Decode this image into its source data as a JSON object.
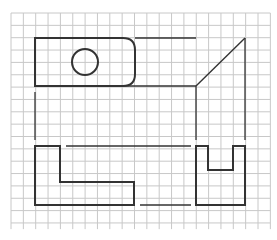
{
  "diagram": {
    "type": "orthographic-projection-exercise",
    "grid": {
      "left": 11,
      "top": 13,
      "cell": 12.35,
      "cols": 21,
      "rows": 17.5,
      "line_color": "#c8c8c8"
    },
    "stroke_color": "#333333",
    "views": {
      "top_view": {
        "outline": "rounded-rectangle",
        "x": 35,
        "y": 38,
        "width": 100,
        "height": 48,
        "corner_radius": 12,
        "hole": {
          "cx": 85,
          "cy": 62,
          "r": 13
        }
      },
      "side_top_view": {
        "frame_top_y": 38,
        "frame_bottom_y": 86,
        "left_x": 196,
        "right_x": 245,
        "miter_line": {
          "x1": 196,
          "y1": 86,
          "x2": 245,
          "y2": 38
        }
      },
      "front_view": {
        "shape": "L-shape",
        "points": [
          [
            35,
            146
          ],
          [
            60,
            146
          ],
          [
            60,
            182
          ],
          [
            134,
            182
          ],
          [
            134,
            205
          ],
          [
            35,
            205
          ]
        ]
      },
      "side_view": {
        "shape": "U-shape",
        "points": [
          [
            196,
            146
          ],
          [
            208,
            146
          ],
          [
            208,
            170
          ],
          [
            233,
            170
          ],
          [
            233,
            146
          ],
          [
            245,
            146
          ],
          [
            245,
            205
          ],
          [
            196,
            205
          ]
        ]
      },
      "projection_lines": [
        {
          "x1": 135,
          "y1": 38,
          "x2": 196,
          "y2": 38
        },
        {
          "x1": 35,
          "y1": 92,
          "x2": 35,
          "y2": 140
        },
        {
          "x1": 196,
          "y1": 86,
          "x2": 196,
          "y2": 140
        },
        {
          "x1": 245,
          "y1": 38,
          "x2": 245,
          "y2": 140
        },
        {
          "x1": 66,
          "y1": 146,
          "x2": 191,
          "y2": 146
        },
        {
          "x1": 140,
          "y1": 205,
          "x2": 191,
          "y2": 205
        }
      ]
    }
  }
}
